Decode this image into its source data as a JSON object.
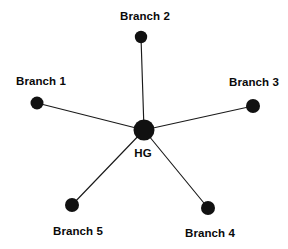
{
  "diagram": {
    "type": "star-topology",
    "title": "",
    "background_color": "#ffffff",
    "node_color": "#111111",
    "edge_color": "#1a1a1a",
    "text_color": "#0a0a0a",
    "hub": {
      "id": "hub",
      "label": "HG",
      "cx": 144,
      "cy": 130,
      "r": 10.5,
      "label_x": 143,
      "label_y": 153
    },
    "branches": [
      {
        "id": "branch-1",
        "label": "Branch 1",
        "cx": 37,
        "cy": 103,
        "r": 6.5,
        "label_x": 41,
        "label_y": 81
      },
      {
        "id": "branch-2",
        "label": "Branch 2",
        "cx": 141,
        "cy": 37,
        "r": 6.2,
        "label_x": 145,
        "label_y": 16
      },
      {
        "id": "branch-3",
        "label": "Branch 3",
        "cx": 253,
        "cy": 106,
        "r": 7,
        "label_x": 254,
        "label_y": 82
      },
      {
        "id": "branch-4",
        "label": "Branch 4",
        "cx": 208,
        "cy": 208,
        "r": 7,
        "label_x": 210,
        "label_y": 233
      },
      {
        "id": "branch-5",
        "label": "Branch 5",
        "cx": 72,
        "cy": 205,
        "r": 7,
        "label_x": 78,
        "label_y": 231
      }
    ],
    "edges": [
      {
        "id": "edge-hub-branch-1",
        "from": "hub",
        "to": "branch-1",
        "x1": 144,
        "y1": 130,
        "x2": 37,
        "y2": 103
      },
      {
        "id": "edge-hub-branch-2",
        "from": "hub",
        "to": "branch-2",
        "x1": 144,
        "y1": 130,
        "x2": 141,
        "y2": 37
      },
      {
        "id": "edge-hub-branch-3",
        "from": "hub",
        "to": "branch-3",
        "x1": 144,
        "y1": 130,
        "x2": 253,
        "y2": 106
      },
      {
        "id": "edge-hub-branch-4",
        "from": "hub",
        "to": "branch-4",
        "x1": 144,
        "y1": 130,
        "x2": 208,
        "y2": 208
      },
      {
        "id": "edge-hub-branch-5",
        "from": "hub",
        "to": "branch-5",
        "x1": 144,
        "y1": 130,
        "x2": 72,
        "y2": 205
      }
    ]
  }
}
